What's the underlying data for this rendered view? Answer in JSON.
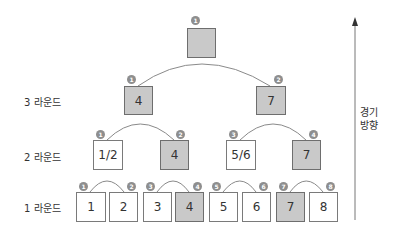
{
  "rounds": [
    {
      "label": "3 라운드"
    },
    {
      "label": "2 라운드"
    },
    {
      "label": "1 라운드"
    }
  ],
  "direction": {
    "line1": "경기",
    "line2": "방향"
  },
  "final": {
    "value": "",
    "badge": "1"
  },
  "round3": [
    {
      "value": "4",
      "badge": "1"
    },
    {
      "value": "7",
      "badge": "2"
    }
  ],
  "round2": [
    {
      "value": "1/2",
      "badge": "1"
    },
    {
      "value": "4",
      "badge": "2"
    },
    {
      "value": "5/6",
      "badge": "3"
    },
    {
      "value": "7",
      "badge": "4"
    }
  ],
  "round1": [
    {
      "value": "1",
      "badge": "1"
    },
    {
      "value": "2",
      "badge": "2"
    },
    {
      "value": "3",
      "badge": "3"
    },
    {
      "value": "4",
      "badge": "4"
    },
    {
      "value": "5",
      "badge": "5"
    },
    {
      "value": "6",
      "badge": "6"
    },
    {
      "value": "7",
      "badge": "7"
    },
    {
      "value": "8",
      "badge": "8"
    }
  ],
  "colors": {
    "winner_fill": "#c9c9c9",
    "border": "#7a7a7a",
    "badge": "#8e8e8e"
  }
}
